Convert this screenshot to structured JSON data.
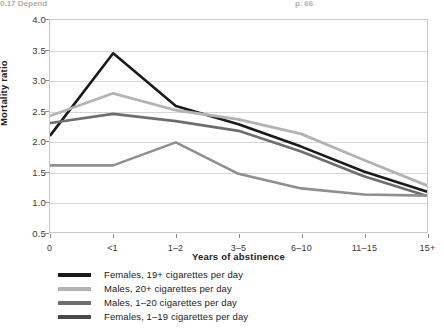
{
  "top_caption": {
    "left_text": "0.17 Depend",
    "right_text": "p. 66"
  },
  "axes": {
    "ylabel": "Mortality ratio",
    "xlabel": "Years of abstinence",
    "yticks": [
      "4.0",
      "3.5",
      "3.0",
      "2.5",
      "2.0",
      "1.5",
      "1.0",
      "0.5"
    ],
    "xticks": [
      "0",
      "<1",
      "1–2",
      "3–5",
      "6–10",
      "11–15",
      "15+"
    ]
  },
  "colors": {
    "series_1": "#1a1a1a",
    "series_2": "#b3b3b3",
    "series_3": "#6e6e6e",
    "series_4": "#8f8f8f",
    "grid": "#d6d6d6",
    "frame": "#c9c9c9",
    "axis_text": "#3a3a3a"
  },
  "legend": {
    "items": [
      {
        "label": "Females, 19+ cigarettes per day",
        "color": "#1a1a1a"
      },
      {
        "label": "Males, 20+ cigarettes per day",
        "color": "#b3b3b3"
      },
      {
        "label": "Males, 1–20 cigarettes per day",
        "color": "#6e6e6e"
      },
      {
        "label": "Females, 1–19 cigarettes per day",
        "color": "#4a4a4a"
      }
    ]
  },
  "chart_data": {
    "type": "line",
    "title": "",
    "xlabel": "Years of abstinence",
    "ylabel": "Mortality ratio",
    "categories": [
      "0",
      "<1",
      "1–2",
      "3–5",
      "6–10",
      "11–15",
      "15+"
    ],
    "ylim": [
      0.5,
      4.0
    ],
    "ytick_step": 0.5,
    "grid": true,
    "legend_position": "below",
    "series": [
      {
        "name": "Females, 19+ cigarettes per day",
        "color": "#1a1a1a",
        "values": [
          2.1,
          3.45,
          2.58,
          2.28,
          1.91,
          1.5,
          1.17
        ]
      },
      {
        "name": "Males, 20+ cigarettes per day",
        "color": "#b3b3b3",
        "values": [
          2.42,
          2.79,
          2.51,
          2.36,
          2.12,
          1.69,
          1.27
        ]
      },
      {
        "name": "Males, 1–20 cigarettes per day",
        "color": "#6e6e6e",
        "values": [
          2.3,
          2.45,
          2.33,
          2.17,
          1.83,
          1.42,
          1.1
        ]
      },
      {
        "name": "Females, 1–19 cigarettes per day",
        "color": "#8f8f8f",
        "values": [
          1.6,
          1.6,
          1.98,
          1.46,
          1.22,
          1.12,
          1.1
        ]
      }
    ]
  }
}
